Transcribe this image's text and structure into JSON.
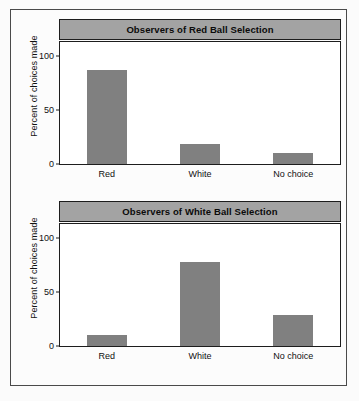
{
  "figure": {
    "ylabel": "Percent of choices made",
    "ytick_labels": [
      "0",
      "50",
      "100"
    ],
    "xtick_labels": [
      "Red",
      "White",
      "No choice"
    ],
    "bar_color": "#808080",
    "title_bar_color": "#a3a3a3",
    "frame_color": "#1d1d1d"
  },
  "chart_data": [
    {
      "type": "bar",
      "title": "Observers of Red Ball Selection",
      "categories": [
        "Red",
        "White",
        "No choice"
      ],
      "values": [
        87,
        19,
        10
      ],
      "xlabel": "",
      "ylabel": "Percent of choices made",
      "ylim": [
        0,
        113
      ],
      "yticks": [
        0,
        50,
        100
      ],
      "grid": false,
      "legend": "none"
    },
    {
      "type": "bar",
      "title": "Observers of White Ball Selection",
      "categories": [
        "Red",
        "White",
        "No choice"
      ],
      "values": [
        10,
        78,
        29
      ],
      "xlabel": "",
      "ylabel": "Percent of choices made",
      "ylim": [
        0,
        113
      ],
      "yticks": [
        0,
        50,
        100
      ],
      "grid": false,
      "legend": "none"
    }
  ]
}
